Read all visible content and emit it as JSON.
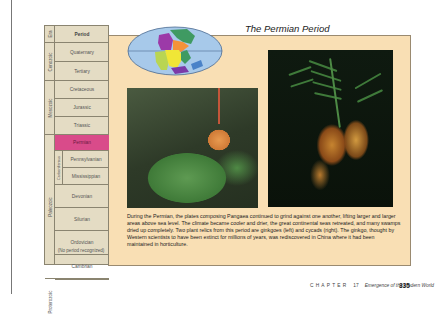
{
  "page": {
    "title": "The Permian Period",
    "body": "During the Permian, the plates composing Pangaea continued to grind against one another, lifting larger and larger areas above sea level. The climate became cooler and drier, the great continental seas retreated, and many swamps dried up completely. Two plant relics from this period are ginkgoes (left) and cycads (right). The ginkgo, thought by Western scientists to have been extinct for millions of years, was rediscovered in China where it had been maintained in horticulture."
  },
  "timescale": {
    "header_era": "Era",
    "header_period": "Period",
    "eras": [
      "Cenozoic",
      "Mesozoic",
      "Paleozoic",
      "Proterozoic"
    ],
    "subgroup": "Carboniferous",
    "periods": [
      "Quaternary",
      "Tertiary",
      "Cretaceous",
      "Jurassic",
      "Triassic",
      "Permian",
      "Pennsylvanian",
      "Mississippian",
      "Devonian",
      "Silurian",
      "Ordovician",
      "Cambrian",
      "(No period recognized)"
    ],
    "highlighted": "Permian",
    "highlight_color": "#d94b8a"
  },
  "images": {
    "map": "pangaea-map",
    "left_photo": "ginkgo-photo",
    "right_photo": "cycad-photo"
  },
  "footer": {
    "chapter_label": "CHAPTER",
    "chapter_number": "17",
    "chapter_title": "Emergence of the Modern World",
    "page_number": "335"
  }
}
